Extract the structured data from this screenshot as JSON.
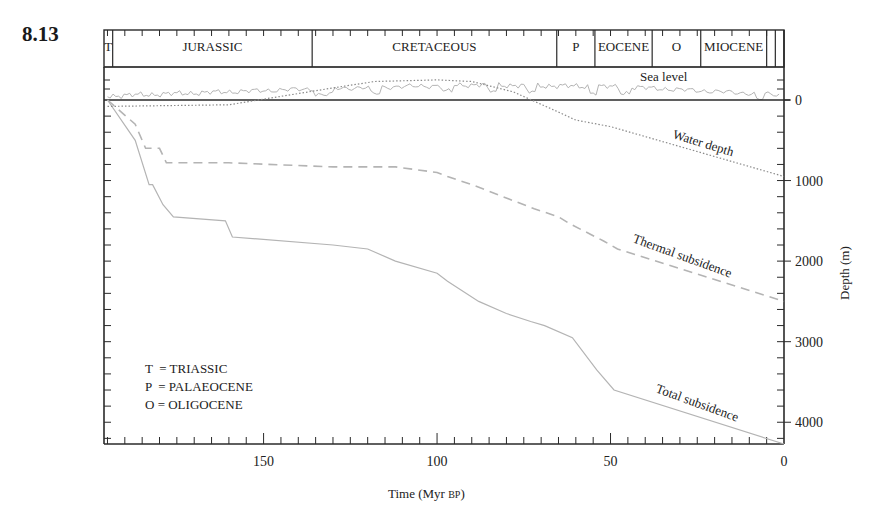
{
  "figure": {
    "number": "8.13"
  },
  "periods": [
    {
      "label": "T",
      "start": 196,
      "end": 193.5
    },
    {
      "label": "JURASSIC",
      "start": 193.5,
      "end": 136
    },
    {
      "label": "CRETACEOUS",
      "start": 136,
      "end": 65.5
    },
    {
      "label": "P",
      "start": 65.5,
      "end": 54.5
    },
    {
      "label": "EOCENE",
      "start": 54.5,
      "end": 38
    },
    {
      "label": "O",
      "start": 38,
      "end": 24
    },
    {
      "label": "MIOCENE",
      "start": 24,
      "end": 5
    },
    {
      "label": "",
      "start": 5,
      "end": 2.5
    },
    {
      "label": "",
      "start": 2.5,
      "end": 0
    }
  ],
  "legend": {
    "lines": [
      "T  = TRIASSIC",
      "P  = PALAEOCENE",
      "O = OLIGOCENE"
    ]
  },
  "labels": {
    "sea_level": "Sea level",
    "water_depth": "Water depth",
    "thermal_subsidence": "Thermal  subsidence",
    "total_subsidence": "Total subsidence"
  },
  "chart_data": {
    "type": "line",
    "title": "",
    "xlabel": "Time (Myr BP)",
    "ylabel": "Depth (m)",
    "xlim": [
      196,
      0
    ],
    "ylim": [
      0,
      4270
    ],
    "x_ticks": [
      150,
      100,
      50,
      0
    ],
    "y_ticks": [
      0,
      1000,
      2000,
      3000,
      4000
    ],
    "grid": false,
    "legend_position": "lower-left (key for period abbreviations)",
    "series": [
      {
        "name": "Total subsidence",
        "style": "solid",
        "x": [
          195,
          187,
          183,
          182,
          179,
          176,
          161,
          159,
          130,
          120,
          112,
          100,
          97,
          88,
          80,
          73,
          69,
          61,
          54,
          49,
          0
        ],
        "y": [
          0,
          500,
          1050,
          1050,
          1300,
          1450,
          1500,
          1700,
          1800,
          1850,
          2000,
          2150,
          2250,
          2500,
          2650,
          2750,
          2800,
          2950,
          3350,
          3600,
          4270
        ]
      },
      {
        "name": "Thermal subsidence",
        "style": "dashed",
        "x": [
          195,
          187,
          184,
          180,
          178,
          160,
          130,
          112,
          100,
          97,
          90,
          72,
          65,
          62,
          52,
          48,
          0
        ],
        "y": [
          0,
          300,
          600,
          600,
          780,
          780,
          830,
          830,
          900,
          950,
          1050,
          1350,
          1450,
          1530,
          1750,
          1850,
          2500
        ]
      },
      {
        "name": "Water depth",
        "style": "dotted",
        "x": [
          195,
          160,
          130,
          118,
          100,
          90,
          78,
          65,
          60,
          50,
          0
        ],
        "y": [
          80,
          60,
          -150,
          -230,
          -250,
          -230,
          -100,
          150,
          250,
          330,
          950
        ]
      },
      {
        "name": "Sea level",
        "style": "solid thin (upper panel, relative)",
        "note": "oscillating eustatic curve in upper panel above 0 datum; rises through Jurassic, highest in Late Cretaceous, falls in Cenozoic"
      }
    ],
    "period_bar": [
      "T",
      "JURASSIC",
      "CRETACEOUS",
      "P",
      "EOCENE",
      "O",
      "MIOCENE"
    ]
  }
}
